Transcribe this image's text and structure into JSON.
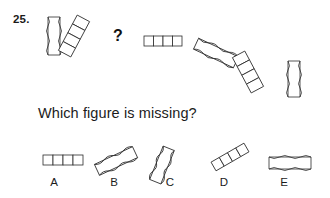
{
  "question": {
    "number": "25.",
    "missing_marker": "?",
    "prompt": "Which figure is missing?"
  },
  "sequence": {
    "description": "Alternating wavy-sided bar and segmented ladder chain, rotating progressively clockwise; third position is blank",
    "items": [
      {
        "id": "seq-1",
        "shape": "wavy-bar",
        "rotation_deg": 0,
        "x": 45,
        "y": 16,
        "w": 18,
        "h": 40,
        "segments": 0,
        "state": "shown"
      },
      {
        "id": "seq-2",
        "shape": "ladder-chain",
        "rotation_deg": 30,
        "x": 64,
        "y": 14,
        "w": 34,
        "h": 44,
        "segments": 4,
        "state": "shown"
      },
      {
        "id": "seq-3",
        "shape": "missing",
        "rotation_deg": 60,
        "x": 108,
        "y": 24,
        "w": 18,
        "h": 22,
        "segments": 0,
        "state": "missing"
      },
      {
        "id": "seq-4",
        "shape": "ladder-bar-h",
        "rotation_deg": 90,
        "x": 143,
        "y": 33,
        "w": 38,
        "h": 16,
        "segments": 4,
        "state": "shown"
      },
      {
        "id": "seq-5",
        "shape": "wavy-bar",
        "rotation_deg": 120,
        "x": 193,
        "y": 44,
        "w": 48,
        "h": 26,
        "segments": 0,
        "state": "shown"
      },
      {
        "id": "seq-6",
        "shape": "ladder-chain",
        "rotation_deg": 150,
        "x": 238,
        "y": 50,
        "w": 36,
        "h": 44,
        "segments": 4,
        "state": "shown"
      },
      {
        "id": "seq-7",
        "shape": "wavy-bar",
        "rotation_deg": 180,
        "x": 286,
        "y": 60,
        "w": 16,
        "h": 38,
        "segments": 0,
        "state": "shown"
      }
    ]
  },
  "options": {
    "items": [
      {
        "label": "A",
        "shape": "ladder-bar-h",
        "rotation_deg": 0,
        "x": 42,
        "y": 150,
        "w": 40,
        "h": 18,
        "segments": 4,
        "label_x": 44,
        "label_y": 176
      },
      {
        "label": "B",
        "shape": "wavy-bar",
        "rotation_deg": -28,
        "x": 92,
        "y": 148,
        "w": 46,
        "h": 24,
        "segments": 0,
        "label_x": 104,
        "label_y": 176
      },
      {
        "label": "C",
        "shape": "wavy-bar",
        "rotation_deg": -22,
        "x": 150,
        "y": 146,
        "w": 20,
        "h": 38,
        "segments": 0,
        "label_x": 160,
        "label_y": 176
      },
      {
        "label": "D",
        "shape": "ladder-chain",
        "rotation_deg": -32,
        "x": 202,
        "y": 150,
        "w": 40,
        "h": 22,
        "segments": 4,
        "label_x": 214,
        "label_y": 176
      },
      {
        "label": "E",
        "shape": "wavy-bar",
        "rotation_deg": 90,
        "x": 268,
        "y": 152,
        "w": 44,
        "h": 18,
        "segments": 0,
        "label_x": 274,
        "label_y": 176
      }
    ]
  },
  "style": {
    "background": "#ffffff",
    "ink": "#2b2b2b",
    "text": "#1c1c1c"
  }
}
